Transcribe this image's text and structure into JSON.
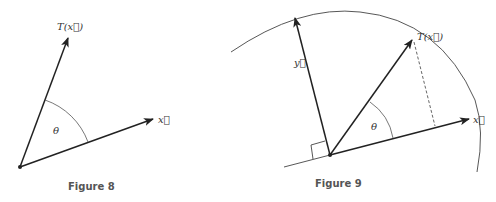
{
  "figures": [
    {
      "caption": "Figure 8",
      "labels": {
        "tx": "T(x⃗)",
        "x": "x⃗",
        "theta": "θ"
      },
      "origin": [
        20,
        167
      ],
      "vectors": {
        "x_tip": [
          154,
          119
        ],
        "tx_tip": [
          68,
          37
        ]
      }
    },
    {
      "caption": "Figure 9",
      "labels": {
        "tx": "T(x⃗)",
        "x": "x⃗",
        "y": "y⃗",
        "theta": "θ"
      },
      "origin": [
        330,
        155
      ],
      "vectors": {
        "x_tip": [
          470,
          118
        ],
        "tx_tip": [
          413,
          39
        ],
        "y_tip": [
          295,
          17
        ]
      }
    }
  ],
  "colors": {
    "line": "#222222",
    "thin": "#444444",
    "caption": "#555555"
  }
}
